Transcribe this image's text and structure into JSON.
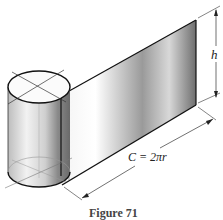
{
  "figure": {
    "caption": "Figure 71",
    "labels": {
      "height": "h",
      "circumference": "C = 2πr"
    }
  }
}
